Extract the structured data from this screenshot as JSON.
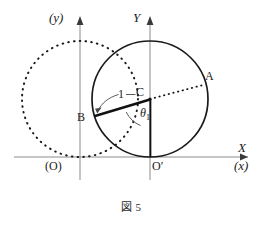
{
  "figure": {
    "caption": "図 5",
    "labels": {
      "y_lower_axis": "(y)",
      "Y_upper_axis": "Y",
      "X_upper_axis": "X",
      "x_lower_axis": "(x)",
      "origin_O": "(O)",
      "origin_Oprime": "O′",
      "point_A": "A",
      "point_B": "B",
      "point_C": "C",
      "radius_one": "1",
      "angle_theta": "θ",
      "angle_theta_sub": "1"
    },
    "colors": {
      "ink": "#1a1a1a",
      "axis": "#808080",
      "dotted": "#1a1a1a"
    },
    "geometry": {
      "rolling_circle": {
        "cx": 150,
        "cy": 99,
        "r": 58,
        "style": "solid"
      },
      "initial_circle": {
        "cx": 80,
        "cy": 99,
        "r": 58,
        "style": "dotted"
      },
      "x_axis_y": 157,
      "Y_axis_x": 150,
      "y_axis_x": 80,
      "point_A": {
        "x": 203,
        "y": 85
      },
      "point_B": {
        "x": 95,
        "y": 116
      },
      "point_C": {
        "x": 150,
        "y": 99
      },
      "point_Oprime": {
        "x": 150,
        "y": 157
      },
      "point_O": {
        "x": 80,
        "y": 157
      }
    }
  }
}
